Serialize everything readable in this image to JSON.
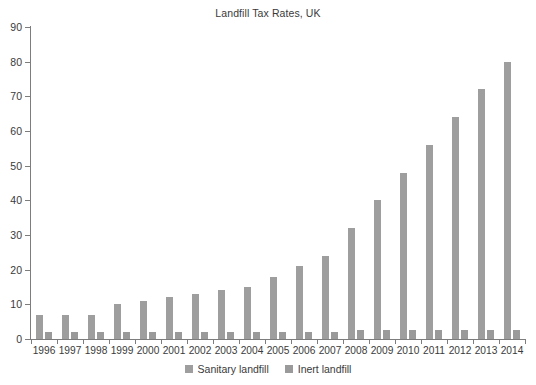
{
  "chart_data": {
    "type": "bar",
    "title": "Landfill Tax Rates, UK",
    "xlabel": "",
    "ylabel": "",
    "ylim": [
      0,
      90
    ],
    "yticks": [
      0,
      10,
      20,
      30,
      40,
      50,
      60,
      70,
      80,
      90
    ],
    "grid": false,
    "legend_position": "bottom",
    "categories": [
      "1996",
      "1997",
      "1998",
      "1999",
      "2000",
      "2001",
      "2002",
      "2003",
      "2004",
      "2005",
      "2006",
      "2007",
      "2008",
      "2009",
      "2010",
      "2011",
      "2012",
      "2013",
      "2014"
    ],
    "series": [
      {
        "name": "Sanitary landfill",
        "color": "#9e9e9e",
        "values": [
          7,
          7,
          7,
          10,
          11,
          12,
          13,
          14,
          15,
          18,
          21,
          24,
          32,
          40,
          48,
          56,
          64,
          72,
          80
        ]
      },
      {
        "name": "Inert landfill",
        "color": "#9a9a9a",
        "values": [
          2,
          2,
          2,
          2,
          2,
          2,
          2,
          2,
          2,
          2,
          2,
          2,
          2.5,
          2.5,
          2.5,
          2.5,
          2.5,
          2.5,
          2.5
        ]
      }
    ]
  },
  "legend": {
    "items": [
      {
        "label": "Sanitary landfill",
        "color": "#9e9e9e"
      },
      {
        "label": "Inert landfill",
        "color": "#9a9a9a"
      }
    ]
  }
}
